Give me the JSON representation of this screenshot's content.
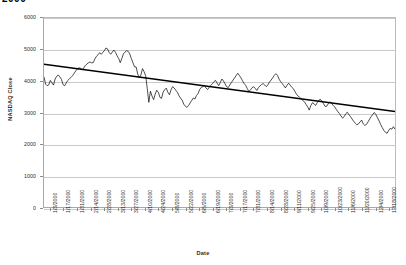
{
  "chart_data": {
    "type": "line",
    "title": "2000",
    "xlabel": "Date",
    "ylabel": "NASDAQ Close",
    "ylim": [
      0,
      6000
    ],
    "ytick_values": [
      0,
      1000,
      2000,
      3000,
      4000,
      5000,
      6000
    ],
    "ytick_labels": [
      "0",
      "1000",
      "2000",
      "3000",
      "4000",
      "5000",
      "6000"
    ],
    "grid": true,
    "legend": "none",
    "xtick_labels": [
      "1/3/2000",
      "1/17/2000",
      "1/31/2000",
      "2/14/2000",
      "2/28/2000",
      "3/13/2000",
      "3/27/2000",
      "4/10/2000",
      "4/24/2000",
      "5/8/2000",
      "5/22/2000",
      "6/5/2000",
      "6/19/2000",
      "7/3/2000",
      "7/17/2000",
      "7/31/2000",
      "8/14/2000",
      "8/28/2000",
      "9/11/2000",
      "9/25/2000",
      "10/9/2000",
      "10/23/2000",
      "11/6/2000",
      "11/20/2000",
      "12/4/2000",
      "12/18/2000"
    ],
    "series": [
      {
        "name": "NASDAQ Close",
        "color": "#000000",
        "style": "line",
        "values": [
          4131,
          3901,
          3850,
          3877,
          4020,
          3940,
          3870,
          4064,
          4151,
          4189,
          4130,
          4050,
          3887,
          3850,
          3940,
          4020,
          4070,
          4112,
          4170,
          4244,
          4321,
          4382,
          4420,
          4400,
          4354,
          4414,
          4489,
          4540,
          4577,
          4604,
          4576,
          4583,
          4696,
          4784,
          4832,
          4900,
          4847,
          4904,
          4963,
          5048,
          5020,
          4907,
          4850,
          4918,
          4980,
          4911,
          4803,
          4717,
          4580,
          4714,
          4860,
          4917,
          4963,
          4940,
          4860,
          4710,
          4580,
          4450,
          4446,
          4223,
          4095,
          4188,
          4392,
          4298,
          4170,
          3769,
          3322,
          3676,
          3524,
          3409,
          3581,
          3707,
          3640,
          3482,
          3447,
          3650,
          3720,
          3774,
          3643,
          3564,
          3720,
          3820,
          3774,
          3702,
          3640,
          3530,
          3455,
          3390,
          3264,
          3199,
          3164,
          3220,
          3303,
          3380,
          3460,
          3428,
          3540,
          3600,
          3729,
          3797,
          3821,
          3860,
          3774,
          3730,
          3797,
          3860,
          3912,
          3980,
          4020,
          3930,
          3853,
          3950,
          4063,
          4003,
          3910,
          3820,
          3790,
          3872,
          3950,
          4027,
          4099,
          4175,
          4246,
          4174,
          4100,
          4007,
          3920,
          3860,
          3760,
          3666,
          3720,
          3790,
          3820,
          3765,
          3700,
          3790,
          3840,
          3890,
          3920,
          3870,
          3820,
          3880,
          3970,
          4030,
          4100,
          4180,
          4234,
          4180,
          4060,
          3980,
          3920,
          3850,
          3780,
          3860,
          3930,
          3870,
          3800,
          3756,
          3670,
          3580,
          3520,
          3480,
          3430,
          3380,
          3340,
          3256,
          3180,
          3075,
          3220,
          3310,
          3280,
          3220,
          3310,
          3390,
          3420,
          3360,
          3280,
          3190,
          3200,
          3280,
          3340,
          3290,
          3230,
          3180,
          3100,
          3030,
          2966,
          2890,
          2820,
          2870,
          2960,
          3010,
          2930,
          2870,
          2790,
          2720,
          2660,
          2610,
          2640,
          2700,
          2760,
          2640,
          2590,
          2620,
          2700,
          2790,
          2870,
          2940,
          3000,
          2930,
          2830,
          2730,
          2620,
          2520,
          2430,
          2370,
          2340,
          2430,
          2500,
          2470,
          2550,
          2470
        ]
      }
    ],
    "trendline": {
      "name": "Linear trend",
      "color": "#000000",
      "start_value": 4530,
      "end_value": 3030
    }
  }
}
